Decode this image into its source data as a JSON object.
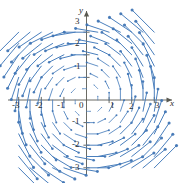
{
  "chart_data": {
    "type": "scatter",
    "plot_kind": "vector-field-quiver",
    "title": "",
    "subtitle": "",
    "xlabel": "x",
    "ylabel": "y",
    "xlim": [
      -3.6,
      3.6
    ],
    "ylim": [
      -3.6,
      3.6
    ],
    "grid": false,
    "legend": null,
    "field_formula": "F(x, y) = (-y, x)",
    "field_description": "Counterclockwise rotational vector field; arrow length grows with distance from origin",
    "rotation": "counterclockwise",
    "x_tick_labels": [
      "-3",
      "-2",
      "-1",
      "0",
      "1",
      "2",
      "3"
    ],
    "x_tick_values": [
      -3,
      -2,
      -1,
      0,
      1,
      2,
      3
    ],
    "y_tick_labels": [
      "3",
      "2",
      "1",
      "-1",
      "-2",
      "-3"
    ],
    "y_tick_values": [
      3,
      2,
      1,
      -1,
      -2,
      -3
    ],
    "origin_label": "0",
    "sample_grid_x": [
      -3,
      -2.5,
      -2,
      -1.5,
      -1,
      -0.5,
      0,
      0.5,
      1,
      1.5,
      2,
      2.5,
      3
    ],
    "sample_grid_y": [
      -3,
      -2.5,
      -2,
      -1.5,
      -1,
      -0.5,
      0,
      0.5,
      1,
      1.5,
      2,
      2.5,
      3
    ],
    "arrow_color": "#4a7fbd",
    "arrow_head_color": "#3f74b4",
    "axis_color": "#5a5a52",
    "vectors": [
      {
        "x": -3,
        "y": 3,
        "u": -3,
        "v": -3
      },
      {
        "x": -2,
        "y": 3,
        "u": -3,
        "v": -2
      },
      {
        "x": -1,
        "y": 3,
        "u": -3,
        "v": -1
      },
      {
        "x": 0,
        "y": 3,
        "u": -3,
        "v": 0
      },
      {
        "x": 1,
        "y": 3,
        "u": -3,
        "v": 1
      },
      {
        "x": 2,
        "y": 3,
        "u": -3,
        "v": 2
      },
      {
        "x": 3,
        "y": 3,
        "u": -3,
        "v": 3
      },
      {
        "x": -3,
        "y": 0,
        "u": 0,
        "v": -3
      },
      {
        "x": 3,
        "y": 0,
        "u": 0,
        "v": 3
      },
      {
        "x": -3,
        "y": -3,
        "u": 3,
        "v": -3
      },
      {
        "x": 0,
        "y": -3,
        "u": 3,
        "v": 0
      },
      {
        "x": 3,
        "y": -3,
        "u": 3,
        "v": 3
      }
    ]
  },
  "axes": {
    "x_axis_label": "x",
    "y_axis_label": "y"
  }
}
